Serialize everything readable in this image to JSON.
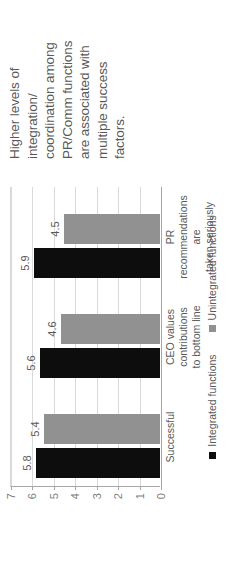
{
  "title": {
    "lines": [
      "Higher levels of",
      "integration/",
      "coordination among",
      "PR/Comm functions",
      "are associated with",
      "multiple success",
      "factors."
    ],
    "full": "Higher levels of integration/ coordination among PR/Comm functions are associated with multiple success factors."
  },
  "chart_data": {
    "type": "bar",
    "title": "",
    "xlabel": "",
    "ylabel": "",
    "ylim": [
      0,
      7
    ],
    "yticks": [
      7,
      6,
      5,
      4,
      3,
      2,
      1,
      0
    ],
    "grid": true,
    "legend_position": "bottom",
    "categories": [
      "Successful",
      "CEO values contributions to bottom line",
      "PR recommendations are taken seriously"
    ],
    "category_lines": [
      [
        "Successful"
      ],
      [
        "CEO values contributions",
        "to bottom line"
      ],
      [
        "PR recommendations are",
        "taken seriously"
      ]
    ],
    "series": [
      {
        "name": "Integrated functions",
        "color": "#0d0d0d",
        "values": [
          5.8,
          5.6,
          5.9
        ]
      },
      {
        "name": "Unintegrated functions",
        "color": "#919191",
        "values": [
          5.4,
          4.6,
          4.5
        ]
      }
    ],
    "data_labels": [
      [
        "5.8",
        "5.4"
      ],
      [
        "5.6",
        "4.6"
      ],
      [
        "5.9",
        "4.5"
      ]
    ]
  }
}
